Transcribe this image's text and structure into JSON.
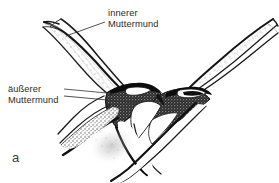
{
  "figure": {
    "panel_letter": "a",
    "background_color": "#ffffff",
    "ink_color": "#1a1a1a",
    "text_color": "#2b2b2b",
    "width": 279,
    "height": 183,
    "annotations": [
      {
        "name": "inner-os",
        "line1": "innerer",
        "line2": "Muttermund",
        "leader": "diagonal line from text left edge down-left to upper tube wall"
      },
      {
        "name": "outer-os",
        "line1": "äußerer",
        "line2": "Muttermund",
        "leader": "horizontal line from text right edge to dark stippled mass"
      }
    ]
  },
  "labels": {
    "inner_os_line1": "innerer",
    "inner_os_line2": "Muttermund",
    "outer_os_line1": "äußerer",
    "outer_os_line2": "Muttermund",
    "panel": "a"
  }
}
